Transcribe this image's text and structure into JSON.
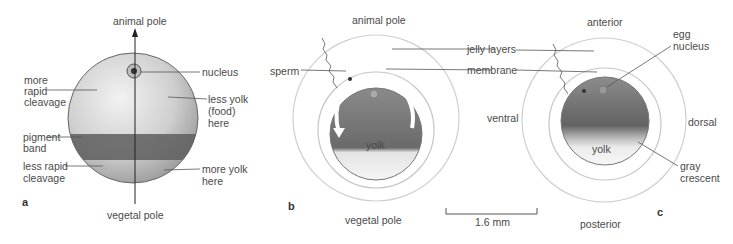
{
  "figure": {
    "panels": [
      {
        "id": "a",
        "label": "a",
        "axis_top": "animal pole",
        "axis_bottom": "vegetal pole",
        "left_labels": [
          "more",
          "rapid",
          "cleavage",
          "pigment",
          "band",
          "less rapid",
          "cleavage"
        ],
        "right_labels": [
          "nucleus",
          "less yolk",
          "(food)",
          "here",
          "more yolk",
          "here"
        ]
      },
      {
        "id": "b",
        "label": "b",
        "top": "animal pole",
        "bottom": "vegetal pole",
        "sperm": "sperm",
        "yolk": "yolk"
      },
      {
        "id": "c",
        "label": "c",
        "top": "anterior",
        "bottom": "posterior",
        "left": "ventral",
        "right": "dorsal",
        "egg_nucleus": [
          "egg",
          "nucleus"
        ],
        "gray_crescent": [
          "gray",
          "crescent"
        ],
        "yolk": "yolk"
      }
    ],
    "shared_labels": {
      "jelly_layers": "jelly layers",
      "membrane": "membrane"
    },
    "scale_bar": "1.6 mm",
    "colors": {
      "egg_dark": "#6e6e6e",
      "egg_light": "#d9d9d9",
      "pigment_band": "#5a5a5a",
      "ring": "#c8c8c8",
      "line": "#555555"
    }
  }
}
